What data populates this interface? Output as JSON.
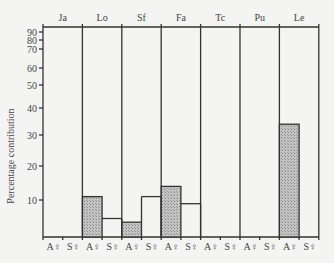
{
  "chart_data": {
    "type": "bar",
    "title": "",
    "xlabel": "",
    "ylabel": "Percentage contribution",
    "groups": [
      "Ja",
      "Lo",
      "Sf",
      "Fa",
      "Tc",
      "Pu",
      "Le"
    ],
    "subcategories": [
      "A♀",
      "S♀"
    ],
    "series": [
      {
        "name": "A♀",
        "style": "hatched",
        "values": [
          0,
          11,
          4,
          14,
          0,
          0,
          34
        ]
      },
      {
        "name": "S♀",
        "style": "open",
        "values": [
          0,
          5,
          11,
          9,
          0,
          0,
          0
        ]
      }
    ],
    "yticks": [
      10,
      20,
      30,
      40,
      50,
      60,
      70,
      80,
      90
    ],
    "ylim": [
      0,
      100
    ],
    "yscale": "nonlinear (compressed toward top)",
    "grid": false,
    "legend": "none"
  },
  "ytick_pixels": {
    "0": 237,
    "10": 200,
    "20": 166,
    "30": 135,
    "40": 108,
    "50": 85,
    "60": 68,
    "70": 49,
    "80": 40,
    "90": 32,
    "100": 27
  },
  "colors": {
    "hatch": "#a8a8a8",
    "line": "#333333",
    "background": "#f4f4f2"
  }
}
